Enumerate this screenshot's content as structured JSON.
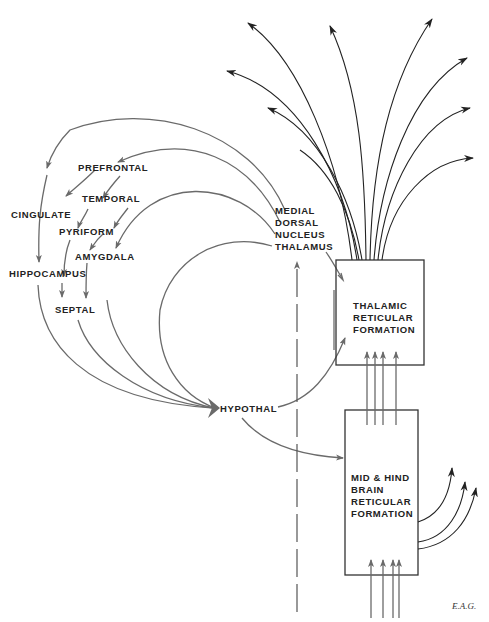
{
  "diagram": {
    "type": "neuroanatomy-flow",
    "colors": {
      "gray_line": "#6a6a6a",
      "black_line": "#222222",
      "text": "#222222",
      "background": "#ffffff"
    },
    "labels": {
      "prefrontal": "PREFRONTAL",
      "cingulate": "CINGULATE",
      "temporal": "TEMPORAL",
      "pyriform": "PYRIFORM",
      "amygdala": "AMYGDALA",
      "hippocampus": "HIPPOCAMPUS",
      "septal": "SEPTAL",
      "hypothal": "HYPOTHAL",
      "mdnt_1": "MEDIAL",
      "mdnt_2": "DORSAL",
      "mdnt_3": "NUCLEUS",
      "mdnt_4": "THALAMUS",
      "trf_1": "THALAMIC",
      "trf_2": "RETICULAR",
      "trf_3": "FORMATION",
      "mhb_1": "MID & HIND",
      "mhb_2": "BRAIN",
      "mhb_3": "RETICULAR",
      "mhb_4": "FORMATION"
    },
    "signature": "E.A.G.",
    "nodes": [
      "Prefrontal",
      "Cingulate",
      "Temporal",
      "Pyriform",
      "Amygdala",
      "Hippocampus",
      "Septal",
      "Hypothal",
      "Medial Dorsal Nucleus Thalamus",
      "Thalamic Reticular Formation",
      "Mid & Hind Brain Reticular Formation"
    ],
    "edges": [
      {
        "from": "Medial Dorsal Nucleus Thalamus",
        "to": "Prefrontal"
      },
      {
        "from": "Medial Dorsal Nucleus Thalamus",
        "to": "Cingulate"
      },
      {
        "from": "Medial Dorsal Nucleus Thalamus",
        "to": "Amygdala"
      },
      {
        "from": "Prefrontal",
        "to": "Cingulate"
      },
      {
        "from": "Prefrontal",
        "to": "Temporal"
      },
      {
        "from": "Temporal",
        "to": "Pyriform"
      },
      {
        "from": "Temporal",
        "to": "Amygdala"
      },
      {
        "from": "Cingulate",
        "to": "Hippocampus"
      },
      {
        "from": "Pyriform",
        "to": "Hippocampus"
      },
      {
        "from": "Pyriform",
        "to": "Amygdala"
      },
      {
        "from": "Hippocampus",
        "to": "Septal"
      },
      {
        "from": "Amygdala",
        "to": "Septal"
      },
      {
        "from": "Hippocampus",
        "to": "Hypothal"
      },
      {
        "from": "Septal",
        "to": "Hypothal"
      },
      {
        "from": "Amygdala",
        "to": "Hypothal"
      },
      {
        "from": "Medial Dorsal Nucleus Thalamus",
        "to": "Hypothal"
      },
      {
        "from": "Hypothal",
        "to": "Thalamic Reticular Formation"
      },
      {
        "from": "Hypothal",
        "to": "Mid & Hind Brain Reticular Formation"
      },
      {
        "from": "Medial Dorsal Nucleus Thalamus",
        "to": "Thalamic Reticular Formation"
      },
      {
        "from": "Mid & Hind Brain Reticular Formation",
        "to": "Thalamic Reticular Formation",
        "count": 4
      },
      {
        "from": "Thalamic Reticular Formation",
        "to": "cortex (diffuse projections)",
        "count": 9
      },
      {
        "from": "Mid & Hind Brain Reticular Formation",
        "to": "ascending outputs",
        "count": 3
      },
      {
        "from": "ascending inputs",
        "to": "Mid & Hind Brain Reticular Formation",
        "count": 4
      }
    ]
  }
}
